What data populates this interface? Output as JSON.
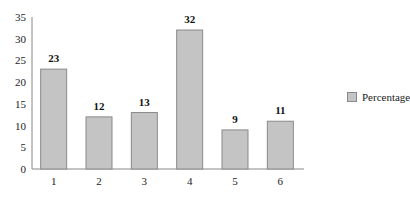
{
  "chart_data": {
    "type": "bar",
    "title": "",
    "xlabel": "",
    "ylabel": "",
    "categories": [
      "1",
      "2",
      "3",
      "4",
      "5",
      "6"
    ],
    "series": [
      {
        "name": "Percentage",
        "values": [
          23,
          12,
          13,
          32,
          9,
          11
        ]
      }
    ],
    "data_labels": [
      "23",
      "12",
      "13",
      "32",
      "9",
      "11"
    ],
    "ylim": [
      0,
      35
    ],
    "yticks": [
      0,
      5,
      10,
      15,
      20,
      25,
      30,
      35
    ],
    "ytick_labels": [
      "0",
      "5",
      "10",
      "15",
      "20",
      "25",
      "30",
      "35"
    ],
    "grid": false,
    "legend": "right",
    "colors": {
      "bar_fill": "#c4c4c4",
      "bar_stroke": "#8a8a8a",
      "axis": "#888888"
    }
  }
}
